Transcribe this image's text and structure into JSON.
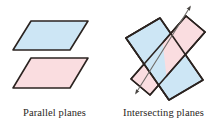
{
  "figure": {
    "background_color": "#ffffff",
    "outline_color": "#2b2320",
    "plane_blue_fill": "#cde6f5",
    "plane_pink_fill": "#fadde0",
    "caption_color": "#2a2622",
    "line_color": "#6d6a66"
  },
  "panels": [
    {
      "id": "parallel-planes",
      "caption": "Parallel planes",
      "shapes": [
        {
          "name": "plane-blue-top",
          "kind": "parallelogram",
          "fill": "#cde6f5",
          "points": "31,21 88,21 70,50 13,50"
        },
        {
          "name": "plane-pink-bottom",
          "kind": "parallelogram",
          "fill": "#fadde0",
          "points": "31,58 88,58 70,88 13,88"
        }
      ]
    },
    {
      "id": "intersecting-planes",
      "caption": "Intersecting planes",
      "shapes": [
        {
          "name": "plane-blue",
          "kind": "parallelogram",
          "fill": "#cde6f5",
          "points": "17,38 51,18 94,80 60,100"
        },
        {
          "name": "plane-pink",
          "kind": "parallelogram",
          "fill": "#fadde0",
          "points": "22,79 77,16 96,32 41,95"
        },
        {
          "name": "intersection-line",
          "kind": "double-arrow-line",
          "from": "27,93",
          "to": "81,7"
        }
      ]
    }
  ]
}
